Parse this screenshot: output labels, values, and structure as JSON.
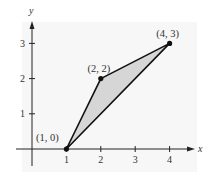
{
  "chart_data": {
    "type": "line",
    "title": "",
    "xlabel": "x",
    "ylabel": "y",
    "x_ticks": [
      "1",
      "2",
      "3",
      "4"
    ],
    "y_ticks": [
      "1",
      "2",
      "3"
    ],
    "xlim": [
      0,
      4.5
    ],
    "ylim": [
      -0.5,
      3.5
    ],
    "grid": false,
    "shape": "filled triangle",
    "points": [
      {
        "x": 1,
        "y": 0,
        "label": "(1, 0)"
      },
      {
        "x": 2,
        "y": 2,
        "label": "(2, 2)"
      },
      {
        "x": 4,
        "y": 3,
        "label": "(4, 3)"
      }
    ],
    "colors": {
      "background": "#f7f7f7",
      "fill": "#d6d6d6",
      "stroke": "#111111",
      "axis": "#222222"
    }
  }
}
